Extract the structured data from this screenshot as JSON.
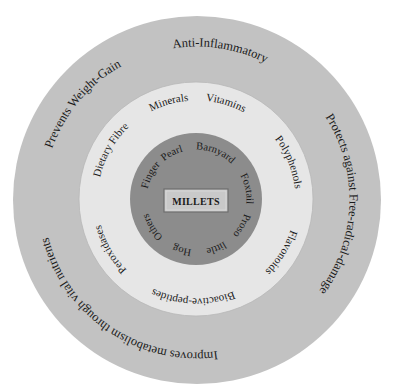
{
  "diagram": {
    "type": "concentric-circles",
    "center": {
      "label": "MILLETS"
    },
    "colors": {
      "outer_ring": "#c2c2c2",
      "middle_ring": "#e6e6e6",
      "inner_circle": "#8c8c8c",
      "center_box_fill": "#c9c9c9",
      "center_box_border": "#6e6e6e",
      "text": "#1a1a1a"
    },
    "inner_ring": {
      "title": "Millet types",
      "items": [
        {
          "label": "Finger",
          "angle": 298
        },
        {
          "label": "Pearl",
          "angle": 332
        },
        {
          "label": "Barnyard",
          "angle": 22
        },
        {
          "label": "Foxtail",
          "angle": 78
        },
        {
          "label": "Proso",
          "angle": 120
        },
        {
          "label": "little",
          "angle": 158
        },
        {
          "label": "Hog",
          "angle": 196
        },
        {
          "label": "Others",
          "angle": 238
        }
      ]
    },
    "middle_ring": {
      "title": "Nutrients",
      "items": [
        {
          "label": "Dietary Fibre",
          "angle": 300
        },
        {
          "label": "Minerals",
          "angle": 344
        },
        {
          "label": "Vitamins",
          "angle": 17
        },
        {
          "label": "Polyphenols",
          "angle": 68
        },
        {
          "label": "Flavonoids",
          "angle": 122
        },
        {
          "label": "Bioactive-peptides",
          "angle": 182
        },
        {
          "label": "Peroxidases",
          "angle": 240
        }
      ]
    },
    "outer_ring": {
      "title": "Health benefits",
      "items": [
        {
          "label": "Anti-Inflammatory",
          "angle": 9
        },
        {
          "label": "Protects against Free-radical-damage",
          "angle": 92
        },
        {
          "label": "Improves metabolism through vital nutrients",
          "angle": 214
        },
        {
          "label": "Prevents Weight-Gain",
          "angle": 310
        }
      ]
    }
  }
}
